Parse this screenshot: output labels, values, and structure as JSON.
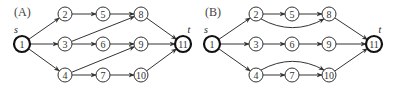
{
  "panels": [
    {
      "label": "(A)",
      "label_pos": [
        14,
        16
      ],
      "source_label": "s",
      "sink_label": "t",
      "nodes": [
        {
          "id": "1",
          "x": 22,
          "y": 44,
          "terminal": true
        },
        {
          "id": "2",
          "x": 65,
          "y": 14
        },
        {
          "id": "3",
          "x": 65,
          "y": 44
        },
        {
          "id": "4",
          "x": 65,
          "y": 75
        },
        {
          "id": "5",
          "x": 103,
          "y": 14
        },
        {
          "id": "6",
          "x": 103,
          "y": 44
        },
        {
          "id": "7",
          "x": 103,
          "y": 75
        },
        {
          "id": "8",
          "x": 141,
          "y": 14
        },
        {
          "id": "9",
          "x": 141,
          "y": 44
        },
        {
          "id": "10",
          "x": 141,
          "y": 75
        },
        {
          "id": "11",
          "x": 183,
          "y": 44,
          "terminal": true
        }
      ],
      "edges": [
        {
          "from": "1",
          "to": "2"
        },
        {
          "from": "1",
          "to": "3"
        },
        {
          "from": "1",
          "to": "4"
        },
        {
          "from": "2",
          "to": "5"
        },
        {
          "from": "5",
          "to": "8"
        },
        {
          "from": "3",
          "to": "8"
        },
        {
          "from": "3",
          "to": "6"
        },
        {
          "from": "6",
          "to": "9"
        },
        {
          "from": "4",
          "to": "9"
        },
        {
          "from": "4",
          "to": "7"
        },
        {
          "from": "7",
          "to": "10"
        },
        {
          "from": "8",
          "to": "11"
        },
        {
          "from": "9",
          "to": "11"
        },
        {
          "from": "10",
          "to": "11"
        }
      ]
    },
    {
      "label": "(B)",
      "label_pos": [
        205,
        16
      ],
      "source_label": "s",
      "sink_label": "t",
      "nodes": [
        {
          "id": "1",
          "x": 212,
          "y": 44,
          "terminal": true
        },
        {
          "id": "2",
          "x": 256,
          "y": 14
        },
        {
          "id": "3",
          "x": 256,
          "y": 44
        },
        {
          "id": "4",
          "x": 256,
          "y": 75
        },
        {
          "id": "5",
          "x": 292,
          "y": 14
        },
        {
          "id": "6",
          "x": 292,
          "y": 44
        },
        {
          "id": "7",
          "x": 292,
          "y": 75
        },
        {
          "id": "8",
          "x": 329,
          "y": 14
        },
        {
          "id": "9",
          "x": 329,
          "y": 44
        },
        {
          "id": "10",
          "x": 329,
          "y": 75
        },
        {
          "id": "11",
          "x": 374,
          "y": 44,
          "terminal": true
        }
      ],
      "edges": [
        {
          "from": "1",
          "to": "2"
        },
        {
          "from": "1",
          "to": "3"
        },
        {
          "from": "1",
          "to": "4"
        },
        {
          "from": "2",
          "to": "5"
        },
        {
          "from": "5",
          "to": "8"
        },
        {
          "from": "2",
          "to": "8",
          "curve": 14
        },
        {
          "from": "3",
          "to": "6"
        },
        {
          "from": "6",
          "to": "9"
        },
        {
          "from": "4",
          "to": "7"
        },
        {
          "from": "7",
          "to": "10"
        },
        {
          "from": "4",
          "to": "10",
          "curve": -14
        },
        {
          "from": "8",
          "to": "11"
        },
        {
          "from": "9",
          "to": "11"
        },
        {
          "from": "10",
          "to": "11"
        }
      ]
    }
  ]
}
